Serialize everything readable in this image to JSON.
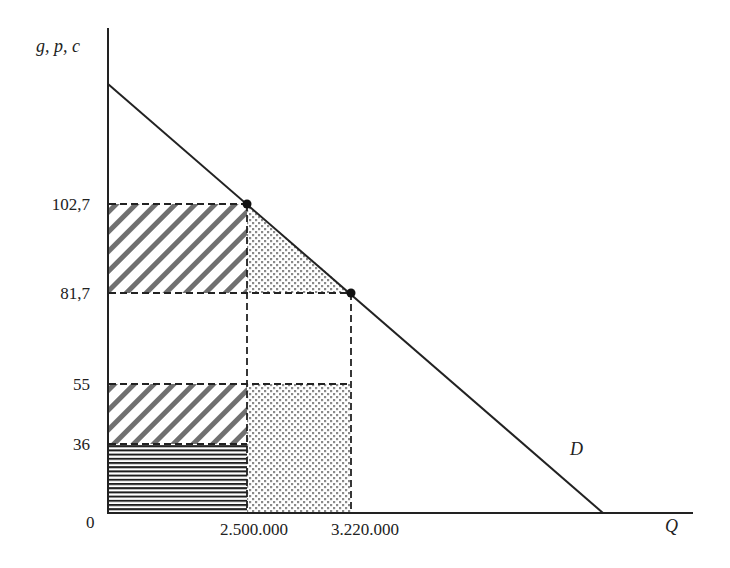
{
  "diagram": {
    "type": "supply-demand-welfare",
    "y_axis_label": "g, p, c",
    "x_axis_label": "Q",
    "origin_label": "0",
    "curve_label": "D",
    "y_ticks": [
      {
        "label": "102,7",
        "value": 102.7
      },
      {
        "label": "81,7",
        "value": 81.7
      },
      {
        "label": "55",
        "value": 55
      },
      {
        "label": "36",
        "value": 36
      }
    ],
    "x_ticks": [
      {
        "label": "2.500.000",
        "value": 2500000
      },
      {
        "label": "3.220.000",
        "value": 3220000
      }
    ],
    "points": [
      {
        "q": 2500000,
        "p": 102.7
      },
      {
        "q": 3220000,
        "p": 81.7
      }
    ],
    "regions": [
      {
        "name": "diagonal-hatch-upper",
        "q_range": [
          0,
          2500000
        ],
        "p_range": [
          81.7,
          102.7
        ],
        "pattern": "diagonal"
      },
      {
        "name": "dotted-triangle",
        "pattern": "dots",
        "vertices": [
          [
            2500000,
            102.7
          ],
          [
            2500000,
            81.7
          ],
          [
            3220000,
            81.7
          ]
        ]
      },
      {
        "name": "diagonal-hatch-lower",
        "q_range": [
          0,
          2500000
        ],
        "p_range": [
          36,
          55
        ],
        "pattern": "diagonal"
      },
      {
        "name": "horizontal-stripes",
        "q_range": [
          0,
          2500000
        ],
        "p_range": [
          0,
          36
        ],
        "pattern": "horizontal"
      },
      {
        "name": "dotted-rectangle",
        "q_range": [
          2500000,
          3220000
        ],
        "p_range": [
          0,
          55
        ],
        "pattern": "dots"
      }
    ],
    "colors": {
      "line": "#222222",
      "hatch": "#707070",
      "dots": "#808080"
    }
  }
}
